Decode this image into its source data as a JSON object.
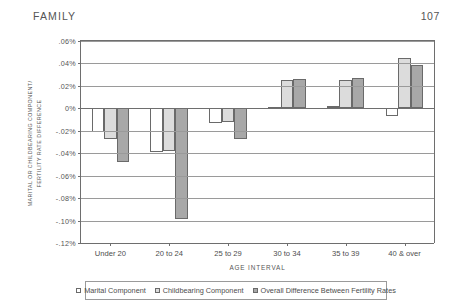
{
  "running_head": {
    "section": "FAMILY",
    "page_number": "107"
  },
  "chart_data": {
    "type": "bar",
    "title": "",
    "xlabel": "AGE INTERVAL",
    "ylabel": "MARITAL OR CHILDBEARING COMPONENT/ FERTILITY RATE DIFFERENCE",
    "ylabel_line1": "MARITAL OR CHILDBEARING COMPONENT/",
    "ylabel_line2": "FERTILITY RATE DIFFERENCE",
    "categories": [
      "Under 20",
      "20 to 24",
      "25 to 29",
      "30 to 34",
      "35 to 39",
      "40 & over"
    ],
    "ylim": [
      -0.12,
      0.06
    ],
    "ytick_labels": [
      ".06%",
      ".04%",
      ".02%",
      "0%",
      "-.02%",
      "-.04%",
      "-.06%",
      "-.08%",
      "-.10%",
      "-.12%"
    ],
    "ytick_values": [
      0.06,
      0.04,
      0.02,
      0,
      -0.02,
      -0.04,
      -0.06,
      -0.08,
      -0.1,
      -0.12
    ],
    "grid": true,
    "legend_position": "bottom",
    "series": [
      {
        "name": "Marital Component",
        "color": "#ffffff",
        "values": [
          -0.021,
          -0.039,
          -0.013,
          0.001,
          0.002,
          -0.007
        ]
      },
      {
        "name": "Childbearing Component",
        "color": "#dcdcdc",
        "values": [
          -0.027,
          -0.038,
          -0.012,
          0.025,
          0.025,
          0.045
        ]
      },
      {
        "name": "Overall Difference Between Fertility Rates",
        "color": "#a8a8a8",
        "values": [
          -0.048,
          -0.099,
          -0.027,
          0.026,
          0.027,
          0.039
        ]
      }
    ]
  }
}
